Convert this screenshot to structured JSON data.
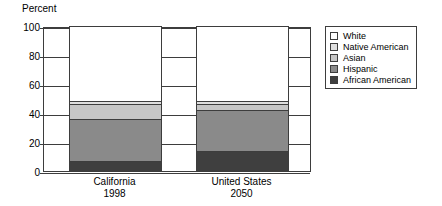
{
  "chart_data": {
    "type": "bar",
    "subtype": "stacked-bar",
    "title": "",
    "ylabel": "Percent",
    "xlabel": "",
    "ylim": [
      0,
      100
    ],
    "yticks": [
      0,
      20,
      40,
      60,
      80,
      100
    ],
    "ytick_labels": [
      "0",
      "20",
      "40",
      "60",
      "80",
      "100"
    ],
    "grid": true,
    "legend_position": "right",
    "categories": [
      "California 1998",
      "United States 2050"
    ],
    "category_labels": [
      {
        "line1": "California",
        "line2": "1998"
      },
      {
        "line1": "United States",
        "line2": "2050"
      }
    ],
    "series": [
      {
        "name": "African American",
        "color": "#3f3f3f",
        "values": [
          7,
          14
        ]
      },
      {
        "name": "Hispanic",
        "color": "#8a8a8a",
        "values": [
          29,
          28
        ]
      },
      {
        "name": "Asian",
        "color": "#c6c6c6",
        "values": [
          10,
          4
        ]
      },
      {
        "name": "Native American",
        "color": "#dedede",
        "values": [
          2,
          2
        ]
      },
      {
        "name": "White",
        "color": "#ffffff",
        "values": [
          52,
          52
        ]
      }
    ],
    "legend_order": [
      "White",
      "Native American",
      "Asian",
      "Hispanic",
      "African American"
    ]
  },
  "legend": {
    "items": [
      {
        "label": "White",
        "color": "#ffffff"
      },
      {
        "label": "Native American",
        "color": "#dedede"
      },
      {
        "label": "Asian",
        "color": "#c6c6c6"
      },
      {
        "label": "Hispanic",
        "color": "#8a8a8a"
      },
      {
        "label": "African American",
        "color": "#3f3f3f"
      }
    ]
  },
  "colors": {
    "axis": "#3d3d3d",
    "background": "#ffffff",
    "text": "#000000"
  }
}
